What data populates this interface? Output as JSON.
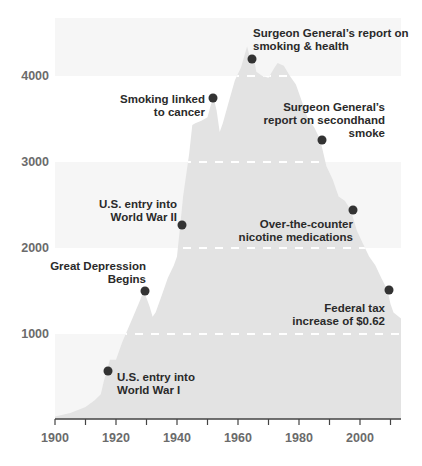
{
  "chart_data": {
    "type": "area",
    "title": "",
    "xlabel": "",
    "ylabel": "",
    "xlim": [
      1900,
      2012
    ],
    "ylim": [
      0,
      4500
    ],
    "grid": "alternating horizontal bands; white dashed lines at 1000-step levels inside area",
    "x_ticks": [
      1900,
      1910,
      1920,
      1930,
      1940,
      1950,
      1960,
      1970,
      1980,
      1990,
      2000,
      2010
    ],
    "x_tick_labels": [
      "1900",
      "1920",
      "1940",
      "1960",
      "1980",
      "2000"
    ],
    "y_tick_labels": [
      "1000",
      "2000",
      "3000",
      "4000"
    ],
    "y_ticks": [
      1000,
      2000,
      3000,
      4000
    ],
    "series": [
      {
        "name": "Per-capita cigarette consumption",
        "x": [
          1900,
          1905,
          1910,
          1913,
          1915,
          1916,
          1917,
          1918,
          1920,
          1922,
          1925,
          1928,
          1929,
          1930,
          1931,
          1932,
          1933,
          1935,
          1937,
          1939,
          1940,
          1941,
          1942,
          1944,
          1945,
          1946,
          1948,
          1950,
          1951,
          1952,
          1953,
          1954,
          1955,
          1957,
          1959,
          1961,
          1963,
          1964,
          1965,
          1966,
          1968,
          1970,
          1972,
          1973,
          1975,
          1977,
          1979,
          1981,
          1983,
          1985,
          1987,
          1989,
          1991,
          1993,
          1995,
          1997,
          1999,
          2001,
          2003,
          2005,
          2007,
          2009,
          2010,
          2011
        ],
        "values": [
          40,
          80,
          150,
          230,
          300,
          450,
          570,
          700,
          700,
          900,
          1150,
          1400,
          1500,
          1420,
          1320,
          1200,
          1250,
          1450,
          1650,
          1800,
          1900,
          2250,
          2600,
          3100,
          3430,
          3450,
          3480,
          3520,
          3650,
          3750,
          3600,
          3350,
          3450,
          3700,
          3950,
          4100,
          4345,
          4200,
          4250,
          4050,
          4000,
          3980,
          4100,
          4150,
          4120,
          4000,
          3900,
          3700,
          3500,
          3400,
          3256,
          2950,
          2800,
          2600,
          2550,
          2442,
          2200,
          2050,
          1900,
          1800,
          1650,
          1512,
          1350,
          1250
        ]
      }
    ],
    "annotations": [
      {
        "year": 1917,
        "value": 570,
        "label": [
          "U.S. entry into",
          "World War I"
        ]
      },
      {
        "year": 1929,
        "value": 1500,
        "label": [
          "Great Depression",
          "Begins"
        ]
      },
      {
        "year": 1941,
        "value": 2270,
        "label": [
          "U.S. entry into",
          "World War II"
        ]
      },
      {
        "year": 1952,
        "value": 3744,
        "label": [
          "Smoking linked",
          "to cancer"
        ]
      },
      {
        "year": 1964,
        "value": 4200,
        "label": [
          "Surgeon General’s report on",
          "smoking & health"
        ]
      },
      {
        "year": 1987,
        "value": 3256,
        "label": [
          "Surgeon General’s",
          "report on secondhand",
          "smoke"
        ]
      },
      {
        "year": 1997,
        "value": 2442,
        "label": [
          "Over-the-counter",
          "nicotine medications"
        ]
      },
      {
        "year": 2009,
        "value": 1512,
        "label": [
          "Federal tax",
          "increase of $0.62"
        ]
      }
    ]
  },
  "colors": {
    "area": "#e3e3e3",
    "band": "#f6f6f6",
    "dot": "#333333",
    "axis": "#444444",
    "label": "#6b6b6b",
    "annotation": "#2a2a2a",
    "dash": "#ffffff"
  },
  "axes": {
    "y": [
      "1000",
      "2000",
      "3000",
      "4000"
    ],
    "x": [
      "1900",
      "1920",
      "1940",
      "1960",
      "1980",
      "2000"
    ]
  },
  "annotations": {
    "ww1": {
      "line1": "U.S. entry into",
      "line2": "World War I"
    },
    "depression": {
      "line1": "Great Depression",
      "line2": "Begins"
    },
    "ww2": {
      "line1": "U.S. entry into",
      "line2": "World War II"
    },
    "cancer": {
      "line1": "Smoking linked",
      "line2": "to cancer"
    },
    "sg1964": {
      "line1": "Surgeon General’s report on",
      "line2": "smoking & health"
    },
    "secondhand": {
      "line1": "Surgeon General’s",
      "line2": "report on secondhand",
      "line3": "smoke"
    },
    "otc": {
      "line1": "Over-the-counter",
      "line2": "nicotine medications"
    },
    "tax": {
      "line1": "Federal tax",
      "line2": "increase of $0.62"
    }
  }
}
